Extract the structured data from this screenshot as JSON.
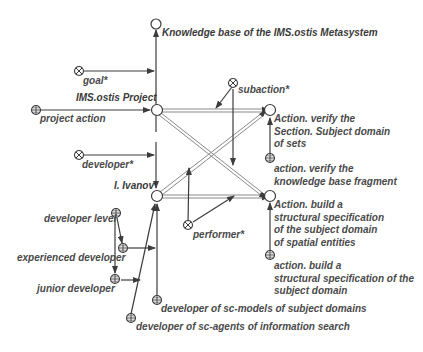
{
  "diagram": {
    "nodes": {
      "kb": {
        "label": "Knowledge base of the IMS.ostis Metasystem",
        "shape": "circle"
      },
      "project": {
        "label": "IMS.ostis Project",
        "shape": "circle"
      },
      "ivanov": {
        "label": "I. Ivanov",
        "shape": "circle"
      },
      "action_verify": {
        "label_lines": [
          "Action. verify the",
          "Section. Subject domain",
          "of sets"
        ],
        "shape": "circle"
      },
      "action_build": {
        "label_lines": [
          "Action. build a",
          "structural specification",
          "of the subject domain",
          "of spatial entities"
        ],
        "shape": "circle"
      },
      "goal": {
        "label": "goal*",
        "shape": "relation-node"
      },
      "subaction": {
        "label": "subaction*",
        "shape": "relation-node"
      },
      "developer": {
        "label": "developer*",
        "shape": "relation-node"
      },
      "performer": {
        "label": "performer*",
        "shape": "relation-node"
      },
      "project_action": {
        "label": "project action",
        "shape": "class-node"
      },
      "class_verify_kb": {
        "label_lines": [
          "action. verify the",
          "knowledge base fragment"
        ],
        "shape": "class-node"
      },
      "class_build_spec": {
        "label_lines": [
          "action. build a",
          "structural specification of the",
          "subject domain"
        ],
        "shape": "class-node"
      },
      "developer_level": {
        "label": "developer level",
        "shape": "class-node"
      },
      "experienced_developer": {
        "label": "experienced developer",
        "shape": "class-node"
      },
      "junior_developer": {
        "label": "junior developer",
        "shape": "class-node"
      },
      "dev_sc_models": {
        "label": "developer of sc-models of subject domains",
        "shape": "class-node"
      },
      "dev_sc_agents": {
        "label": "developer of sc-agents of information search",
        "shape": "class-node"
      }
    },
    "colors": {
      "line": "#3c3c3c",
      "double_line": "#8a8a8a",
      "text": "#4a4a4a",
      "background": "#ffffff"
    }
  }
}
